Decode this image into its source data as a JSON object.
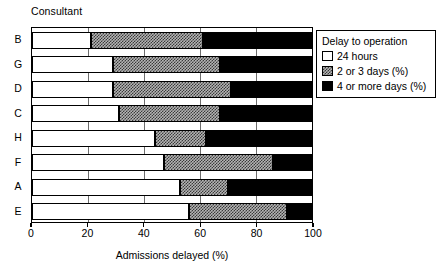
{
  "chart_data": {
    "type": "bar",
    "orientation": "horizontal",
    "stacked": true,
    "title": "",
    "xlabel": "Admissions delayed (%)",
    "ylabel": "Consultant",
    "xlim": [
      0,
      100
    ],
    "xticks": [
      0,
      20,
      40,
      60,
      80,
      100
    ],
    "xticklabels": [
      "0",
      "20",
      "40",
      "60",
      "80",
      "100"
    ],
    "grid": "vertical",
    "categories": [
      "B",
      "G",
      "D",
      "C",
      "H",
      "F",
      "A",
      "E"
    ],
    "legend": {
      "title": "Delay to operation",
      "position": "top-right",
      "entries": [
        {
          "label": "24 hours",
          "fill": "white",
          "color": "#ffffff"
        },
        {
          "label": "2 or 3 days (%)",
          "fill": "checkered",
          "color": "#b4b4b4"
        },
        {
          "label": "4 or more days (%)",
          "fill": "solid",
          "color": "#000000"
        }
      ]
    },
    "series": [
      {
        "name": "24 hours",
        "values": [
          21,
          29,
          29,
          31,
          44,
          47,
          53,
          56
        ]
      },
      {
        "name": "2 or 3 days (%)",
        "values": [
          40,
          38,
          42,
          36,
          18,
          39,
          17,
          35
        ]
      },
      {
        "name": "4 or more days (%)",
        "values": [
          39,
          33,
          29,
          33,
          38,
          14,
          30,
          9
        ]
      }
    ],
    "cumulative": [
      {
        "category": "B",
        "boundaries": [
          21,
          61,
          100
        ]
      },
      {
        "category": "G",
        "boundaries": [
          29,
          67,
          100
        ]
      },
      {
        "category": "D",
        "boundaries": [
          29,
          71,
          100
        ]
      },
      {
        "category": "C",
        "boundaries": [
          31,
          67,
          100
        ]
      },
      {
        "category": "H",
        "boundaries": [
          44,
          62,
          100
        ]
      },
      {
        "category": "F",
        "boundaries": [
          47,
          86,
          100
        ]
      },
      {
        "category": "A",
        "boundaries": [
          53,
          70,
          100
        ]
      },
      {
        "category": "E",
        "boundaries": [
          56,
          91,
          100
        ]
      }
    ]
  }
}
